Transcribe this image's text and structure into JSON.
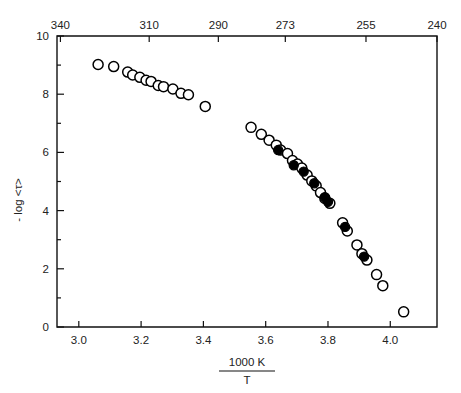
{
  "chart_data": {
    "type": "scatter",
    "title": "",
    "xlabel": "1000 K / T",
    "xlabel_numerator": "1000 K",
    "xlabel_denominator": "T",
    "ylabel": "- log <τ>",
    "ylabel_parts": {
      "minus": "-",
      "log": "log",
      "tau": "τ"
    },
    "top_axis_label": "T (K)",
    "xlim": [
      2.93,
      4.15
    ],
    "ylim": [
      0,
      10
    ],
    "grid": false,
    "legend": "none",
    "xticks": [
      3.0,
      3.2,
      3.4,
      3.6,
      3.8,
      4.0
    ],
    "xticklabels": [
      "3.0",
      "3.2",
      "3.4",
      "3.6",
      "3.8",
      "4.0"
    ],
    "yticks": [
      0,
      2,
      4,
      6,
      8,
      10
    ],
    "yticklabels": [
      "0",
      "2",
      "4",
      "6",
      "8",
      "10"
    ],
    "yminorticks": [
      1,
      3,
      5,
      7,
      9
    ],
    "top_ticks_x": [
      2.941,
      3.226,
      3.448,
      3.663,
      3.922,
      4.167
    ],
    "top_ticklabels": [
      "340",
      "310",
      "290",
      "273",
      "255",
      "240"
    ],
    "series": [
      {
        "name": "open-circles",
        "marker": "open circle",
        "color": "#000000",
        "fill": "none",
        "points": [
          [
            3.062,
            9.02
          ],
          [
            3.112,
            8.95
          ],
          [
            3.157,
            8.76
          ],
          [
            3.173,
            8.66
          ],
          [
            3.196,
            8.58
          ],
          [
            3.216,
            8.48
          ],
          [
            3.232,
            8.44
          ],
          [
            3.255,
            8.3
          ],
          [
            3.272,
            8.26
          ],
          [
            3.302,
            8.18
          ],
          [
            3.328,
            8.03
          ],
          [
            3.352,
            7.98
          ],
          [
            3.406,
            7.58
          ],
          [
            3.553,
            6.86
          ],
          [
            3.586,
            6.62
          ],
          [
            3.611,
            6.42
          ],
          [
            3.634,
            6.25
          ],
          [
            3.648,
            6.08
          ],
          [
            3.67,
            5.96
          ],
          [
            3.686,
            5.72
          ],
          [
            3.702,
            5.6
          ],
          [
            3.716,
            5.46
          ],
          [
            3.733,
            5.22
          ],
          [
            3.748,
            5.02
          ],
          [
            3.762,
            4.85
          ],
          [
            3.776,
            4.62
          ],
          [
            3.79,
            4.42
          ],
          [
            3.806,
            4.25
          ],
          [
            3.847,
            3.58
          ],
          [
            3.862,
            3.3
          ],
          [
            3.893,
            2.82
          ],
          [
            3.909,
            2.52
          ],
          [
            3.925,
            2.3
          ],
          [
            3.956,
            1.8
          ],
          [
            3.976,
            1.42
          ],
          [
            4.043,
            0.52
          ]
        ]
      },
      {
        "name": "filled-circles",
        "marker": "filled circle",
        "color": "#000000",
        "fill": "#000000",
        "points": [
          [
            3.64,
            6.08
          ],
          [
            3.69,
            5.56
          ],
          [
            3.722,
            5.34
          ],
          [
            3.756,
            4.94
          ],
          [
            3.79,
            4.46
          ],
          [
            3.8,
            4.3
          ],
          [
            3.855,
            3.44
          ],
          [
            3.916,
            2.42
          ]
        ]
      }
    ]
  }
}
